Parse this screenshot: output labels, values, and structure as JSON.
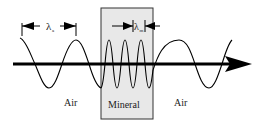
{
  "diagram": {
    "labels": {
      "air_left": "Air",
      "mineral": "Mineral",
      "air_right": "Air",
      "lambda_air": "λ",
      "lambda_air_sub": "a",
      "lambda_mineral": "λ",
      "lambda_mineral_sub": "m"
    },
    "colors": {
      "mineral_fill": "#e8e8e8",
      "line": "#000000"
    }
  }
}
